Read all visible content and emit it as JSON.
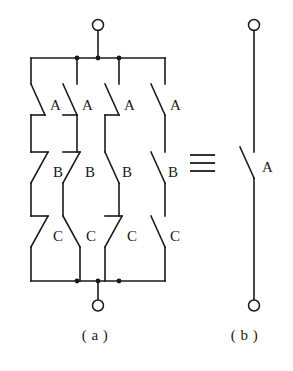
{
  "figure": {
    "type": "switching-circuit-equivalence",
    "stroke_color": "#1a1a1a",
    "background_color": "#ffffff",
    "equivalence_symbol": "≡",
    "captions": {
      "left": "( a )",
      "right": "( b )"
    }
  },
  "circuit_a": {
    "name": "parallel-series-network",
    "branch_count": 4,
    "rows": [
      {
        "row_label": "A",
        "switches": [
          {
            "label": "A",
            "branch": 1,
            "blade_direction": "backslash"
          },
          {
            "label": "A",
            "branch": 2,
            "blade_direction": "backslash"
          },
          {
            "label": "A",
            "branch": 3,
            "blade_direction": "backslash"
          },
          {
            "label": "A",
            "branch": 4,
            "blade_direction": "backslash"
          }
        ]
      },
      {
        "row_label": "B",
        "switches": [
          {
            "label": "B",
            "branch": 1,
            "blade_direction": "slash"
          },
          {
            "label": "B",
            "branch": 2,
            "blade_direction": "slash"
          },
          {
            "label": "B",
            "branch": 3,
            "blade_direction": "backslash"
          },
          {
            "label": "B",
            "branch": 4,
            "blade_direction": "backslash"
          }
        ]
      },
      {
        "row_label": "C",
        "switches": [
          {
            "label": "C",
            "branch": 1,
            "blade_direction": "slash"
          },
          {
            "label": "C",
            "branch": 2,
            "blade_direction": "backslash"
          },
          {
            "label": "C",
            "branch": 3,
            "blade_direction": "slash"
          },
          {
            "label": "C",
            "branch": 4,
            "blade_direction": "backslash"
          }
        ]
      }
    ],
    "terminals": [
      {
        "position": "top",
        "style": "open-circle"
      },
      {
        "position": "bottom",
        "style": "open-circle"
      }
    ],
    "bus_junction_dots": {
      "top": 3,
      "bottom": 3
    }
  },
  "circuit_b": {
    "name": "single-contact-network",
    "switches": [
      {
        "label": "A",
        "blade_direction": "backslash"
      }
    ],
    "terminals": [
      {
        "position": "top",
        "style": "open-circle"
      },
      {
        "position": "bottom",
        "style": "open-circle"
      }
    ]
  }
}
